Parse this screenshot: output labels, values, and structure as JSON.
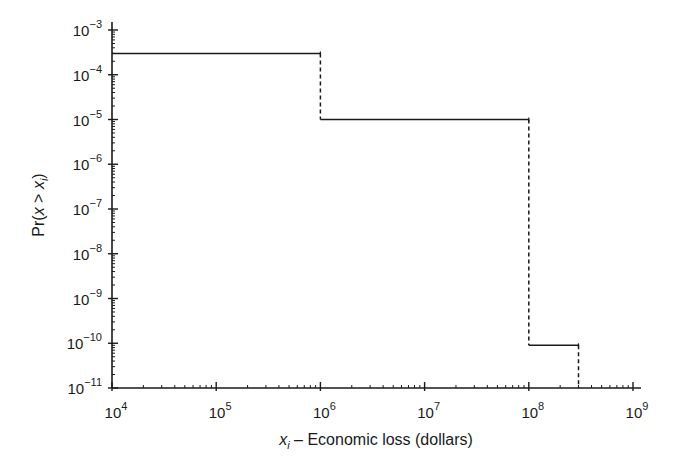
{
  "chart_data": {
    "type": "line",
    "subtype": "step (exceedance probability curve)",
    "title": "",
    "xlabel": "x_i – Economic loss (dollars)",
    "xlabel_parts": {
      "var": "x",
      "sub": "i",
      "rest": " – Economic loss (dollars)"
    },
    "ylabel": "Pr(x > x_i)",
    "ylabel_parts": {
      "pre": "Pr(",
      "var": "x",
      "op": " > ",
      "var2": "x",
      "sub": "i",
      "post": ")"
    },
    "xscale": "log",
    "yscale": "log",
    "xlim": [
      10000,
      1000000000
    ],
    "ylim": [
      1e-11,
      0.001
    ],
    "grid": false,
    "legend": null,
    "x_ticks": [
      {
        "base": "10",
        "exp": "4",
        "value": 10000
      },
      {
        "base": "10",
        "exp": "5",
        "value": 100000
      },
      {
        "base": "10",
        "exp": "6",
        "value": 1000000
      },
      {
        "base": "10",
        "exp": "7",
        "value": 10000000
      },
      {
        "base": "10",
        "exp": "8",
        "value": 100000000
      },
      {
        "base": "10",
        "exp": "9",
        "value": 1000000000
      }
    ],
    "y_ticks": [
      {
        "base": "10",
        "exp": "−3",
        "value": 0.001
      },
      {
        "base": "10",
        "exp": "−4",
        "value": 0.0001
      },
      {
        "base": "10",
        "exp": "−5",
        "value": 1e-05
      },
      {
        "base": "10",
        "exp": "−6",
        "value": 1e-06
      },
      {
        "base": "10",
        "exp": "−7",
        "value": 1e-07
      },
      {
        "base": "10",
        "exp": "−8",
        "value": 1e-08
      },
      {
        "base": "10",
        "exp": "−9",
        "value": 1e-09
      },
      {
        "base": "10",
        "exp": "−10",
        "value": 1e-10
      },
      {
        "base": "10",
        "exp": "−11",
        "value": 1e-11
      }
    ],
    "series": [
      {
        "name": "Exceedance probability",
        "style": "solid horizontal segments, dashed vertical drops",
        "steps": [
          {
            "x_start": 10000,
            "x_end": 1000000,
            "y": 0.0003
          },
          {
            "x_start": 1000000,
            "x_end": 100000000,
            "y": 1e-05
          },
          {
            "x_start": 100000000,
            "x_end": 300000000,
            "y": 9e-11
          }
        ]
      }
    ]
  },
  "colors": {
    "line": "#1a1a1a",
    "background": "#ffffff"
  }
}
